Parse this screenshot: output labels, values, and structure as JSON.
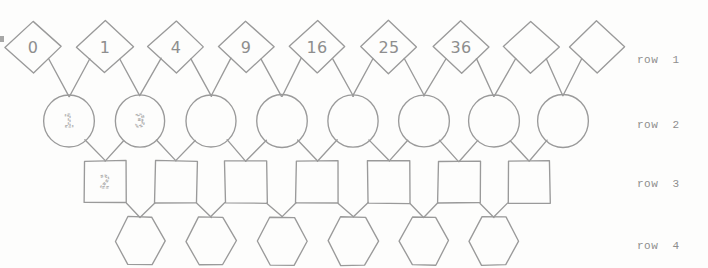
{
  "figure": {
    "title": "",
    "background_color": "#fdfdfc",
    "stroke_color": "#9a9a9a",
    "label_color": "#8e8e8e",
    "dotted_label_color": "#b4b4b4"
  },
  "row_labels": [
    {
      "id": "row-1",
      "text": "row  1",
      "x": 637,
      "y": 54
    },
    {
      "id": "row-2",
      "text": "row  2",
      "x": 637,
      "y": 119
    },
    {
      "id": "row-3",
      "text": "row  3",
      "x": 637,
      "y": 178
    },
    {
      "id": "row-4",
      "text": "row  4",
      "x": 637,
      "y": 240
    }
  ],
  "rows": [
    {
      "row": 1,
      "shape": "diamond",
      "count": 9,
      "cy": 47,
      "half_width": 28,
      "half_height": 26,
      "nodes": [
        {
          "index": 0,
          "cx": 33,
          "label": "0",
          "dotted": false
        },
        {
          "index": 1,
          "cx": 105,
          "label": "1",
          "dotted": false
        },
        {
          "index": 2,
          "cx": 176,
          "label": "4",
          "dotted": false
        },
        {
          "index": 3,
          "cx": 246,
          "label": "9",
          "dotted": false
        },
        {
          "index": 4,
          "cx": 317,
          "label": "16",
          "dotted": false
        },
        {
          "index": 5,
          "cx": 389,
          "label": "25",
          "dotted": false
        },
        {
          "index": 6,
          "cx": 461,
          "label": "36",
          "dotted": false
        },
        {
          "index": 7,
          "cx": 531,
          "label": "",
          "dotted": false
        },
        {
          "index": 8,
          "cx": 597,
          "label": "",
          "dotted": false
        }
      ]
    },
    {
      "row": 2,
      "shape": "circle",
      "count": 8,
      "cy": 121,
      "radius": 25,
      "nodes": [
        {
          "index": 0,
          "cx": 69,
          "label": "1",
          "dotted": true
        },
        {
          "index": 1,
          "cx": 140,
          "label": "3",
          "dotted": true
        },
        {
          "index": 2,
          "cx": 211,
          "label": "",
          "dotted": false
        },
        {
          "index": 3,
          "cx": 282,
          "label": "",
          "dotted": false
        },
        {
          "index": 4,
          "cx": 353,
          "label": "",
          "dotted": false
        },
        {
          "index": 5,
          "cx": 424,
          "label": "",
          "dotted": false
        },
        {
          "index": 6,
          "cx": 494,
          "label": "",
          "dotted": false
        },
        {
          "index": 7,
          "cx": 563,
          "label": "",
          "dotted": false
        }
      ]
    },
    {
      "row": 3,
      "shape": "square",
      "count": 7,
      "cy": 182,
      "half_size": 21,
      "nodes": [
        {
          "index": 0,
          "cx": 105,
          "label": "2",
          "dotted": true
        },
        {
          "index": 1,
          "cx": 176,
          "label": "",
          "dotted": false
        },
        {
          "index": 2,
          "cx": 246,
          "label": "",
          "dotted": false
        },
        {
          "index": 3,
          "cx": 317,
          "label": "",
          "dotted": false
        },
        {
          "index": 4,
          "cx": 389,
          "label": "",
          "dotted": false
        },
        {
          "index": 5,
          "cx": 459,
          "label": "",
          "dotted": false
        },
        {
          "index": 6,
          "cx": 529,
          "label": "",
          "dotted": false
        }
      ]
    },
    {
      "row": 4,
      "shape": "hexagon",
      "count": 6,
      "cy": 241,
      "half_width": 25,
      "half_height": 24,
      "nodes": [
        {
          "index": 0,
          "cx": 140,
          "label": "",
          "dotted": false
        },
        {
          "index": 1,
          "cx": 211,
          "label": "",
          "dotted": false
        },
        {
          "index": 2,
          "cx": 282,
          "label": "",
          "dotted": false
        },
        {
          "index": 3,
          "cx": 353,
          "label": "",
          "dotted": false
        },
        {
          "index": 4,
          "cx": 424,
          "label": "",
          "dotted": false
        },
        {
          "index": 5,
          "cx": 494,
          "label": "",
          "dotted": false
        }
      ]
    }
  ],
  "edges": {
    "description": "Each node in a lower row connects upward to the two adjacent nodes in the row above (Pascal-style triangle lattice).",
    "pairs": [
      {
        "from_row": 2,
        "to_row": 1
      },
      {
        "from_row": 3,
        "to_row": 2
      },
      {
        "from_row": 4,
        "to_row": 3
      }
    ]
  },
  "artifacts": [
    {
      "id": "edge-speck-left",
      "x": 0,
      "y": 36,
      "w": 4,
      "h": 6
    }
  ]
}
